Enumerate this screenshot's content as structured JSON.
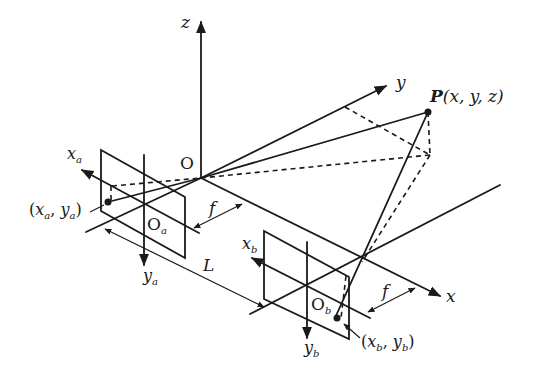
{
  "diagram": {
    "axes": {
      "z": "z",
      "y": "y",
      "x": "x"
    },
    "origin": "O",
    "point": {
      "name": "P",
      "coords": "(x, y, z)"
    },
    "camera_a": {
      "axis_x": "x",
      "axis_x_sub": "a",
      "axis_y": "y",
      "axis_y_sub": "a",
      "center": "O",
      "center_sub": "a",
      "image_point_open": "(",
      "image_point_x": "x",
      "image_point_x_sub": "a",
      "image_point_sep": ", ",
      "image_point_y": "y",
      "image_point_y_sub": "a",
      "image_point_close": ")"
    },
    "camera_b": {
      "axis_x": "x",
      "axis_x_sub": "b",
      "axis_y": "y",
      "axis_y_sub": "b",
      "center": "O",
      "center_sub": "b",
      "image_point_open": "(",
      "image_point_x": "x",
      "image_point_x_sub": "b",
      "image_point_sep": ", ",
      "image_point_y": "y",
      "image_point_y_sub": "b",
      "image_point_close": ")"
    },
    "focal_length_a": "f",
    "focal_length_b": "f",
    "baseline": "L",
    "colors": {
      "line": "#1a1a1a",
      "background": "#ffffff"
    }
  }
}
